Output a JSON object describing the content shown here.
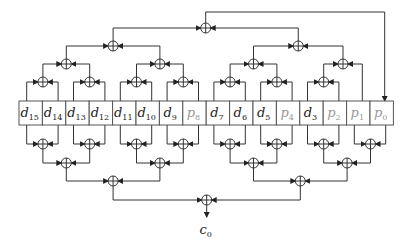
{
  "diagram": {
    "cells": [
      {
        "name": "d",
        "sub": "15",
        "kind": "data"
      },
      {
        "name": "d",
        "sub": "14",
        "kind": "data"
      },
      {
        "name": "d",
        "sub": "13",
        "kind": "data"
      },
      {
        "name": "d",
        "sub": "12",
        "kind": "data"
      },
      {
        "name": "d",
        "sub": "11",
        "kind": "data"
      },
      {
        "name": "d",
        "sub": "10",
        "kind": "data"
      },
      {
        "name": "d",
        "sub": "9",
        "kind": "data"
      },
      {
        "name": "p",
        "sub": "8",
        "kind": "parity"
      },
      {
        "name": "d",
        "sub": "7",
        "kind": "data"
      },
      {
        "name": "d",
        "sub": "6",
        "kind": "data"
      },
      {
        "name": "d",
        "sub": "5",
        "kind": "data"
      },
      {
        "name": "p",
        "sub": "4",
        "kind": "parity"
      },
      {
        "name": "d",
        "sub": "3",
        "kind": "data"
      },
      {
        "name": "p",
        "sub": "2",
        "kind": "parity"
      },
      {
        "name": "p",
        "sub": "1",
        "kind": "parity"
      },
      {
        "name": "p",
        "sub": "0",
        "kind": "parity"
      }
    ],
    "top_tree": {
      "description": "XOR of bits d15..p1 fed into p0",
      "target": "p0"
    },
    "bottom_tree": {
      "description": "XOR of all 16 bits producing c0",
      "output": {
        "name": "c",
        "sub": "0"
      }
    },
    "colors": {
      "data_text": "#222222",
      "parity_text": "#999999",
      "wire": "#333333"
    }
  }
}
